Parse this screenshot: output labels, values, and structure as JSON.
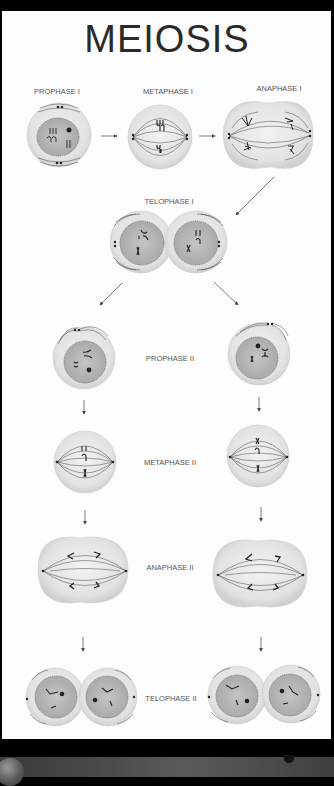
{
  "title": "MEIOSIS",
  "stages": {
    "prophase_1": "PROPHASE I",
    "metaphase_1": "METAPHASE I",
    "anaphase_1": "ANAPHASE I",
    "telophase_1": "TELOPHASE I",
    "prophase_2": "PROPHASE II",
    "metaphase_2": "METAPHASE II",
    "anaphase_2": "ANAPHASE II",
    "telophase_2": "TELOPHASE II"
  },
  "colors": {
    "background": "#000000",
    "panel": "#fdfdfd",
    "cell_fill": "#e6e6e6",
    "nucleus_fill": "#b8b8b8",
    "line": "#444444"
  }
}
